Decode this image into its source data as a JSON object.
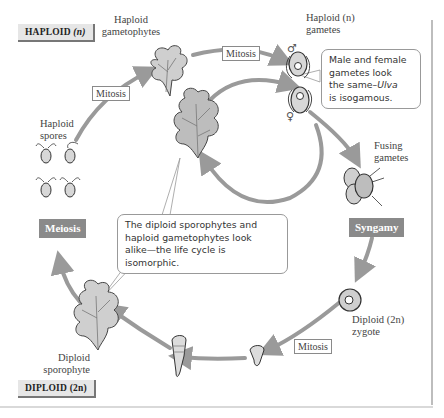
{
  "figure": {
    "type": "life-cycle-diagram"
  },
  "regions": {
    "haploid_label": "HAPLOID",
    "haploid_symbol": "(n)",
    "diploid_label": "DIPLOID",
    "diploid_symbol": "(2n)"
  },
  "stages": {
    "gametophytes": {
      "line1": "Haploid",
      "line2": "gametophytes"
    },
    "gametes": {
      "line1": "Haploid (n)",
      "line2": "gametes"
    },
    "fusing": {
      "line1": "Fusing",
      "line2": "gametes"
    },
    "zygote": {
      "line1": "Diploid (2n)",
      "line2": "zygote"
    },
    "sporophyte": {
      "line1": "Diploid",
      "line2": "sporophyte"
    },
    "spores": {
      "line1": "Haploid",
      "line2": "spores"
    }
  },
  "processes": {
    "mitosis_top": "Mitosis",
    "mitosis_left": "Mitosis",
    "mitosis_bottom": "Mitosis",
    "syngamy": "Syngamy",
    "meiosis": "Meiosis"
  },
  "symbols": {
    "male": "♂",
    "female": "♀"
  },
  "callouts": {
    "isogamy": {
      "line1": "Male and female",
      "line2": "gametes look",
      "line3_prefix": "the same–",
      "line3_italic": "Ulva",
      "line4": "is isogamous."
    },
    "isomorphic": {
      "line1": "The diploid sporophytes and",
      "line2": "haploid gametophytes look",
      "line3": "alike—the life cycle is isomorphic."
    }
  },
  "colors": {
    "arrow": "#9a9a9a",
    "process_box": "#8a8a8a",
    "tag_bg": "#e6e6e6",
    "frame": "#bdbdbd"
  }
}
